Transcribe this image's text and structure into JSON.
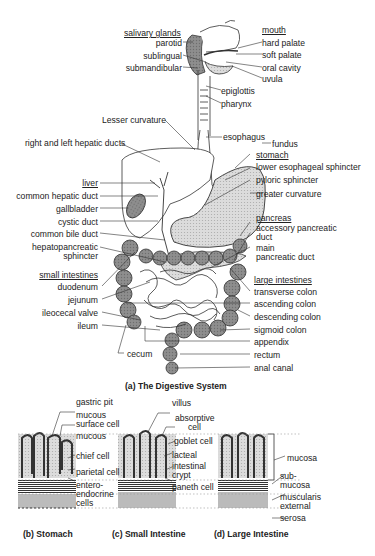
{
  "figure": {
    "main_caption": "(a) The Digestive System",
    "sub_captions": {
      "stomach": "(b) Stomach",
      "small_intestine": "(c) Small Intestine",
      "large_intestine": "(d) Large Intestine"
    }
  },
  "labels": {
    "salivary_glands": {
      "heading": "salivary glands",
      "items": [
        "parotid",
        "sublingual",
        "submandibular"
      ]
    },
    "mouth": {
      "heading": "mouth",
      "items": [
        "hard palate",
        "soft palate",
        "oral cavity",
        "uvula"
      ]
    },
    "throat": [
      "epiglottis",
      "pharynx"
    ],
    "lesser_curvature": "Lesser curvature",
    "esophagus": "esophagus",
    "fundus": "fundus",
    "stomach": {
      "heading": "stomach",
      "items": [
        "lower esophageal sphincter",
        "pyloric sphincter",
        "greater curvature"
      ]
    },
    "hepatic_ducts": "right and left hepatic ducts",
    "liver": {
      "heading": "liver",
      "items": [
        "common hepatic duct",
        "gallbladder",
        "cystic duct",
        "common bile duct",
        "hepatopancreatic",
        "sphincter"
      ]
    },
    "pancreas": {
      "heading": "pancreas",
      "items": [
        "accessory pancreatic",
        "duct",
        "main",
        "pancreatic duct"
      ]
    },
    "small_intestines": {
      "heading": "small intestines",
      "items": [
        "duodenum",
        "jejunum",
        "ileocecal valve",
        "ileum"
      ]
    },
    "cecum": "cecum",
    "large_intestines": {
      "heading": "large intestines",
      "items": [
        "transverse colon",
        "ascending colon",
        "descending colon",
        "sigmoid colon",
        "appendix",
        "rectum",
        "anal canal"
      ]
    },
    "stomach_wall": [
      "gastric pit",
      "mucous",
      "surface cell",
      "mucous",
      "chief cell",
      "parietal cell",
      "entero-",
      "endocrine",
      "cells"
    ],
    "small_intestine_wall": [
      "villus",
      "absorptive",
      "cell",
      "goblet cell",
      "lacteal",
      "intestinal",
      "crypt",
      "paneth cell"
    ],
    "layers": [
      "mucosa",
      "sub-",
      "mucosa",
      "muscularis",
      "external",
      "serosa"
    ]
  },
  "colors": {
    "line": "#333333",
    "organ_fill": "#9a9a9a",
    "light_fill": "#d8d8d8",
    "background": "#ffffff"
  }
}
